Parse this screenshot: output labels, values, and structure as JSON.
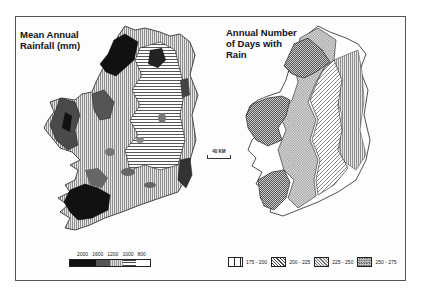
{
  "figure": {
    "left_map": {
      "title_line1": "Mean Annual",
      "title_line2": "Rainfall (mm)",
      "legend": {
        "tick_labels": [
          "2000",
          "1600",
          "1200",
          "1000",
          "800"
        ],
        "classes": [
          {
            "label": "2000+",
            "fill": "#111111"
          },
          {
            "label": "1600-2000",
            "fill": "#555555"
          },
          {
            "label": "1200-1600",
            "fill": "#9a9a9a"
          },
          {
            "label": "1000-1200",
            "fill": "#d0d0d0"
          },
          {
            "label": "800-1000",
            "fill": "#ffffff"
          }
        ]
      }
    },
    "right_map": {
      "title_line1": "Annual Number",
      "title_line2": "of Days with",
      "title_line3": "Rain",
      "legend": [
        {
          "label": "175 - 200",
          "pattern": "vertical-lines"
        },
        {
          "label": "200 - 225",
          "pattern": "diagonal-lines"
        },
        {
          "label": "225 - 250",
          "pattern": "light-crosshatch"
        },
        {
          "label": "250 - 275",
          "pattern": "dense-crosshatch"
        }
      ]
    },
    "scale_bar": {
      "label": "40 KM"
    }
  }
}
